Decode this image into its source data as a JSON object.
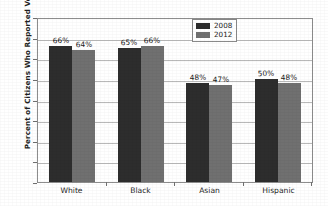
{
  "chart_data": {
    "type": "bar",
    "title": "",
    "subtitle": "",
    "xlabel": "",
    "ylabel": "Percent of Citizens Who Reported Voting",
    "categories": [
      "White",
      "Black",
      "Asian",
      "Hispanic"
    ],
    "series": [
      {
        "name": "2008",
        "color": "#2d2d2d",
        "values": [
          66,
          65,
          48,
          50
        ],
        "labels": [
          "66%",
          "65%",
          "48%",
          "50%"
        ]
      },
      {
        "name": "2012",
        "color": "#707070",
        "values": [
          64,
          66,
          47,
          48
        ],
        "labels": [
          "64%",
          "66%",
          "47%",
          "48%"
        ]
      }
    ],
    "ylim": [
      0,
      80
    ],
    "ytick_values": [
      0,
      10,
      20,
      30,
      40,
      50,
      60,
      70,
      80
    ],
    "ytick_labels": [
      "0",
      "10",
      "20",
      "30",
      "40",
      "50",
      "60",
      "70",
      "80"
    ],
    "grid": true,
    "grid_axis": "y",
    "legend_position": "top-right-inside",
    "value_labels": true,
    "value_label_suffix": "%"
  },
  "axes": {
    "y_title": "Percent of Citizens Who Reported Voting"
  },
  "legend": {
    "entries": [
      {
        "label": "2008",
        "color": "#2d2d2d"
      },
      {
        "label": "2012",
        "color": "#707070"
      }
    ]
  },
  "colors": {
    "series_2008": "#2d2d2d",
    "series_2012": "#707070",
    "gridline": "#b9b9b9",
    "axis": "#8d8d8d",
    "text": "#1f1f1f",
    "background": "#ffffff"
  }
}
